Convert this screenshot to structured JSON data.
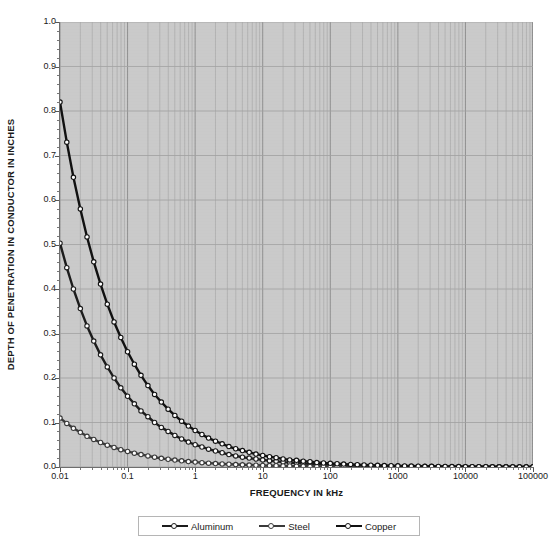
{
  "chart_data": {
    "type": "line",
    "title": "SKIN EFFECT IN DIFFERENT CONDUCTIVE MATERIALS",
    "xlabel": "FREQUENCY IN kHz",
    "ylabel": "DEPTH OF PENETRATION IN CONDUCTOR IN INCHES",
    "xscale": "log",
    "yscale": "linear",
    "xlim": [
      0.01,
      100000
    ],
    "ylim": [
      0.0,
      1.0
    ],
    "grid": true,
    "legend_position": "bottom",
    "xticks": [
      "0.01",
      "0.1",
      "1",
      "10",
      "100",
      "1000",
      "10000",
      "100000"
    ],
    "xtick_values": [
      0.01,
      0.1,
      1,
      10,
      100,
      1000,
      10000,
      100000
    ],
    "yticks": [
      "0.0",
      "0.1",
      "0.2",
      "0.3",
      "0.4",
      "0.5",
      "0.6",
      "0.7",
      "0.8",
      "0.9",
      "1.0"
    ],
    "ytick_values": [
      0.0,
      0.1,
      0.2,
      0.3,
      0.4,
      0.5,
      0.6,
      0.7,
      0.8,
      0.9,
      1.0
    ],
    "plot_background": "#c9c9c9",
    "series": [
      {
        "name": "Aluminum",
        "color": "#1c1c1c",
        "marker": "open-circle",
        "x": [
          0.01,
          0.0126,
          0.0158,
          0.02,
          0.0251,
          0.0316,
          0.0398,
          0.0501,
          0.0631,
          0.0794,
          0.1,
          0.126,
          0.158,
          0.2,
          0.251,
          0.316,
          0.398,
          0.501,
          0.631,
          0.794,
          1,
          1.26,
          1.58,
          2,
          2.51,
          3.16,
          3.98,
          5.01,
          6.31,
          7.94,
          10,
          12.6,
          15.8,
          20,
          25.1,
          31.6,
          39.8,
          50.1,
          63.1,
          79.4,
          100,
          126,
          158,
          200,
          251,
          316,
          398,
          501,
          631,
          794,
          1000,
          1260,
          1580,
          2000,
          2510,
          3160,
          3980,
          5010,
          6310,
          7940,
          10000,
          12600,
          15800,
          20000,
          25100,
          31600,
          39800,
          50100,
          63100,
          79400,
          100000
        ],
        "y": [
          0.503,
          0.448,
          0.4,
          0.356,
          0.317,
          0.283,
          0.252,
          0.225,
          0.2,
          0.178,
          0.159,
          0.142,
          0.126,
          0.113,
          0.1,
          0.089,
          0.08,
          0.071,
          0.063,
          0.056,
          0.05,
          0.045,
          0.04,
          0.036,
          0.032,
          0.028,
          0.025,
          0.022,
          0.02,
          0.018,
          0.016,
          0.014,
          0.013,
          0.011,
          0.01,
          0.0089,
          0.008,
          0.0071,
          0.0063,
          0.0056,
          0.005,
          0.0045,
          0.004,
          0.0036,
          0.0032,
          0.0028,
          0.0025,
          0.0022,
          0.002,
          0.0018,
          0.0016,
          0.0014,
          0.0013,
          0.0011,
          0.001,
          0.0009,
          0.0008,
          0.0007,
          0.0006,
          0.0006,
          0.0005,
          0.0004,
          0.0004,
          0.0004,
          0.0003,
          0.0003,
          0.0003,
          0.0002,
          0.0002,
          0.0002,
          0.0002
        ]
      },
      {
        "name": "Steel",
        "color": "#3a3a3a",
        "marker": "open-circle",
        "x": [
          0.01,
          0.0126,
          0.0158,
          0.02,
          0.0251,
          0.0316,
          0.0398,
          0.0501,
          0.0631,
          0.0794,
          0.1,
          0.126,
          0.158,
          0.2,
          0.251,
          0.316,
          0.398,
          0.501,
          0.631,
          0.794,
          1,
          1.26,
          1.58,
          2,
          2.51,
          3.16,
          3.98,
          5.01,
          6.31,
          7.94,
          10,
          12.6,
          15.8,
          20,
          25.1,
          31.6,
          39.8,
          50.1,
          63.1,
          79.4,
          100,
          126,
          158,
          200,
          251,
          316,
          398,
          501,
          631,
          794,
          1000,
          1260,
          1580,
          2000,
          2510,
          3160,
          3980,
          5010,
          6310,
          7940,
          10000,
          12600,
          15800,
          20000,
          25100,
          31600,
          39800,
          50100,
          63100,
          79400,
          100000
        ],
        "y": [
          0.11,
          0.098,
          0.087,
          0.078,
          0.069,
          0.062,
          0.055,
          0.049,
          0.044,
          0.039,
          0.035,
          0.031,
          0.028,
          0.025,
          0.022,
          0.0195,
          0.0174,
          0.0155,
          0.0138,
          0.0123,
          0.011,
          0.0098,
          0.0087,
          0.0078,
          0.0069,
          0.0062,
          0.0055,
          0.0049,
          0.0044,
          0.0039,
          0.0035,
          0.0031,
          0.0028,
          0.0025,
          0.0022,
          0.002,
          0.0017,
          0.0016,
          0.0014,
          0.0012,
          0.0011,
          0.001,
          0.0009,
          0.0008,
          0.0007,
          0.0006,
          0.0006,
          0.0005,
          0.0004,
          0.0004,
          0.0003,
          0.0003,
          0.0003,
          0.0002,
          0.0002,
          0.0002,
          0.0002,
          0.0002,
          0.0001,
          0.0001,
          0.0001,
          0.0001,
          0.0001,
          0.0001,
          0.0001,
          0.0001,
          0.0,
          0.0,
          0.0,
          0.0,
          0.0
        ]
      },
      {
        "name": "Copper",
        "color": "#111111",
        "marker": "open-circle",
        "x": [
          0.01,
          0.0126,
          0.0158,
          0.02,
          0.0251,
          0.0316,
          0.0398,
          0.0501,
          0.0631,
          0.0794,
          0.1,
          0.126,
          0.158,
          0.2,
          0.251,
          0.316,
          0.398,
          0.501,
          0.631,
          0.794,
          1,
          1.26,
          1.58,
          2,
          2.51,
          3.16,
          3.98,
          5.01,
          6.31,
          7.94,
          10,
          12.6,
          15.8,
          20,
          25.1,
          31.6,
          39.8,
          50.1,
          63.1,
          79.4,
          100,
          126,
          158,
          200,
          251,
          316,
          398,
          501,
          631,
          794,
          1000,
          1260,
          1580,
          2000,
          2510,
          3160,
          3980,
          5010,
          6310,
          7940,
          10000,
          12600,
          15800,
          20000,
          25100,
          31600,
          39800,
          50100,
          63100,
          79400,
          100000
        ],
        "y": [
          0.82,
          0.73,
          0.651,
          0.58,
          0.517,
          0.461,
          0.411,
          0.366,
          0.326,
          0.291,
          0.259,
          0.231,
          0.206,
          0.183,
          0.163,
          0.146,
          0.13,
          0.116,
          0.103,
          0.092,
          0.082,
          0.073,
          0.065,
          0.058,
          0.052,
          0.046,
          0.041,
          0.037,
          0.033,
          0.029,
          0.026,
          0.023,
          0.021,
          0.018,
          0.016,
          0.015,
          0.013,
          0.012,
          0.01,
          0.009,
          0.0082,
          0.0073,
          0.0065,
          0.0058,
          0.0052,
          0.0046,
          0.0041,
          0.0037,
          0.0033,
          0.0029,
          0.0026,
          0.0023,
          0.0021,
          0.0018,
          0.0016,
          0.0015,
          0.0013,
          0.0012,
          0.001,
          0.0009,
          0.0008,
          0.0007,
          0.0007,
          0.0006,
          0.0005,
          0.0005,
          0.0004,
          0.0004,
          0.0003,
          0.0003,
          0.0003
        ]
      }
    ]
  },
  "legend": {
    "items": [
      {
        "label": "Aluminum"
      },
      {
        "label": "Steel"
      },
      {
        "label": "Copper"
      }
    ]
  }
}
